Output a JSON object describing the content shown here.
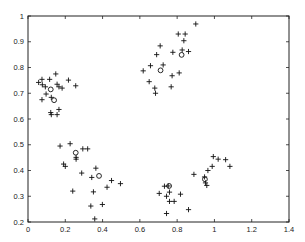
{
  "chart_data": {
    "type": "scatter",
    "title": "",
    "xlabel": "",
    "ylabel": "",
    "xlim": [
      0,
      1.4
    ],
    "ylim": [
      0.2,
      1.0
    ],
    "grid": false,
    "legend": null,
    "xticks": [
      "0",
      "0.2",
      "0.4",
      "0.6",
      "0.8",
      "1",
      "1.2",
      "1.4"
    ],
    "yticks": [
      "0.2",
      "0.3",
      "0.4",
      "0.5",
      "0.6",
      "0.7",
      "0.8",
      "0.9",
      "1"
    ],
    "series": [
      {
        "name": "data points",
        "marker": "+",
        "points": [
          [
            0.075,
            0.754
          ],
          [
            0.116,
            0.754
          ],
          [
            0.149,
            0.775
          ],
          [
            0.217,
            0.751
          ],
          [
            0.057,
            0.742
          ],
          [
            0.077,
            0.733
          ],
          [
            0.093,
            0.725
          ],
          [
            0.156,
            0.735
          ],
          [
            0.166,
            0.725
          ],
          [
            0.183,
            0.72
          ],
          [
            0.256,
            0.729
          ],
          [
            0.097,
            0.697
          ],
          [
            0.075,
            0.675
          ],
          [
            0.125,
            0.684
          ],
          [
            0.122,
            0.625
          ],
          [
            0.125,
            0.617
          ],
          [
            0.166,
            0.637
          ],
          [
            0.156,
            0.617
          ],
          [
            0.172,
            0.495
          ],
          [
            0.226,
            0.504
          ],
          [
            0.294,
            0.484
          ],
          [
            0.32,
            0.484
          ],
          [
            0.191,
            0.425
          ],
          [
            0.2,
            0.416
          ],
          [
            0.258,
            0.451
          ],
          [
            0.258,
            0.444
          ],
          [
            0.288,
            0.39
          ],
          [
            0.24,
            0.32
          ],
          [
            0.342,
            0.373
          ],
          [
            0.364,
            0.409
          ],
          [
            0.351,
            0.317
          ],
          [
            0.448,
            0.361
          ],
          [
            0.496,
            0.349
          ],
          [
            0.424,
            0.335
          ],
          [
            0.337,
            0.262
          ],
          [
            0.399,
            0.268
          ],
          [
            0.358,
            0.212
          ],
          [
            0.618,
            0.787
          ],
          [
            0.657,
            0.807
          ],
          [
            0.709,
            0.884
          ],
          [
            0.69,
            0.85
          ],
          [
            0.725,
            0.81
          ],
          [
            0.65,
            0.745
          ],
          [
            0.68,
            0.72
          ],
          [
            0.684,
            0.7
          ],
          [
            0.777,
            0.859
          ],
          [
            0.773,
            0.768
          ],
          [
            0.768,
            0.725
          ],
          [
            0.806,
            0.93
          ],
          [
            0.843,
            0.93
          ],
          [
            0.836,
            0.904
          ],
          [
            0.827,
            0.868
          ],
          [
            0.861,
            0.862
          ],
          [
            0.811,
            0.779
          ],
          [
            0.9,
            0.969
          ],
          [
            0.732,
            0.339
          ],
          [
            0.752,
            0.34
          ],
          [
            0.704,
            0.311
          ],
          [
            0.743,
            0.3
          ],
          [
            0.759,
            0.316
          ],
          [
            0.759,
            0.28
          ],
          [
            0.784,
            0.28
          ],
          [
            0.818,
            0.308
          ],
          [
            0.743,
            0.233
          ],
          [
            0.861,
            0.248
          ],
          [
            0.89,
            0.385
          ],
          [
            0.947,
            0.375
          ],
          [
            0.965,
            0.4
          ],
          [
            0.994,
            0.454
          ],
          [
            1.02,
            0.444
          ],
          [
            1.06,
            0.442
          ],
          [
            1.083,
            0.416
          ],
          [
            0.988,
            0.416
          ],
          [
            0.952,
            0.352
          ],
          [
            0.959,
            0.342
          ]
        ]
      },
      {
        "name": "centers",
        "marker": "o",
        "points": [
          [
            0.122,
            0.715
          ],
          [
            0.14,
            0.673
          ],
          [
            0.256,
            0.469
          ],
          [
            0.381,
            0.379
          ],
          [
            0.711,
            0.789
          ],
          [
            0.824,
            0.849
          ],
          [
            0.757,
            0.34
          ],
          [
            0.949,
            0.366
          ]
        ]
      }
    ]
  },
  "layout": {
    "plot_left": 28,
    "plot_right": 289,
    "plot_top": 16,
    "plot_bottom": 222,
    "colors": {
      "axis": "#222222",
      "marker": "#111111",
      "background": "#ffffff"
    }
  }
}
